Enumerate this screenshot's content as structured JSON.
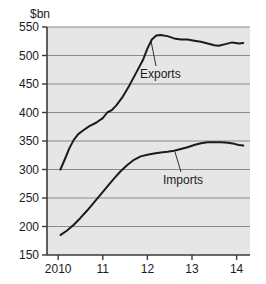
{
  "chart_data": {
    "type": "line",
    "title": "",
    "ylabel": "$bn",
    "xlabel": "",
    "ylim": [
      150,
      550
    ],
    "xlim": [
      2009.75,
      2014.3
    ],
    "grid": true,
    "legend_position": "inline-annotation",
    "yticks": [
      150,
      200,
      250,
      300,
      350,
      400,
      450,
      500,
      550
    ],
    "ytick_labels": [
      "150",
      "200",
      "250",
      "300",
      "350",
      "400",
      "450",
      "500",
      "550"
    ],
    "xticks": [
      2010,
      2011,
      2012,
      2013,
      2014
    ],
    "xtick_labels": [
      "2010",
      "11",
      "12",
      "13",
      "14"
    ],
    "series": [
      {
        "name": "Exports",
        "color": "#1b1b1b",
        "x": [
          2010.05,
          2010.15,
          2010.25,
          2010.35,
          2010.45,
          2010.55,
          2010.7,
          2010.85,
          2011.0,
          2011.1,
          2011.2,
          2011.3,
          2011.45,
          2011.6,
          2011.75,
          2011.9,
          2012.0,
          2012.1,
          2012.2,
          2012.3,
          2012.45,
          2012.6,
          2012.75,
          2012.9,
          2013.05,
          2013.2,
          2013.35,
          2013.5,
          2013.6,
          2013.75,
          2013.9,
          2014.05,
          2014.15
        ],
        "y": [
          300,
          318,
          337,
          352,
          362,
          368,
          376,
          382,
          390,
          400,
          404,
          412,
          428,
          448,
          470,
          492,
          512,
          528,
          535,
          536,
          534,
          530,
          528,
          528,
          526,
          524,
          521,
          518,
          517,
          520,
          523,
          521,
          522
        ]
      },
      {
        "name": "Imports",
        "color": "#1b1b1b",
        "x": [
          2010.05,
          2010.2,
          2010.35,
          2010.5,
          2010.65,
          2010.8,
          2010.95,
          2011.1,
          2011.25,
          2011.4,
          2011.55,
          2011.7,
          2011.85,
          2012.0,
          2012.15,
          2012.3,
          2012.45,
          2012.6,
          2012.75,
          2012.9,
          2013.05,
          2013.2,
          2013.35,
          2013.5,
          2013.65,
          2013.8,
          2013.95,
          2014.05,
          2014.15
        ],
        "y": [
          185,
          193,
          203,
          215,
          228,
          242,
          256,
          270,
          284,
          297,
          308,
          317,
          323,
          326,
          328,
          330,
          331,
          333,
          336,
          339,
          343,
          346,
          348,
          348,
          348,
          347,
          345,
          343,
          342
        ]
      }
    ],
    "annotations": [
      {
        "label": "Exports",
        "text_x": 140,
        "text_y": 78,
        "leader_x1": 156,
        "leader_y1": 66,
        "leader_x2": 151,
        "leader_y2": 41
      },
      {
        "label": "Imports",
        "text_x": 163,
        "text_y": 184,
        "leader_x1": 181,
        "leader_y1": 172,
        "leader_x2": 175,
        "leader_y2": 152
      }
    ],
    "style": {
      "plot_background": "#e6e6e6",
      "grid_color": "#8a8a8a",
      "axis_color": "#3a3a3a",
      "line_color": "#1b1b1b",
      "page_background": "#ffffff"
    }
  }
}
